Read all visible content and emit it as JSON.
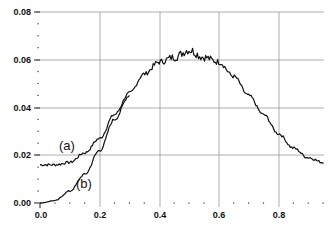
{
  "chart_data": {
    "type": "line",
    "title": "",
    "xlabel": "",
    "ylabel": "",
    "xlim": [
      0.0,
      0.95
    ],
    "ylim": [
      0.0,
      0.08
    ],
    "grid": true,
    "x_ticks": [
      "0.0",
      "0.2",
      "0.4",
      "0.6",
      "0.8"
    ],
    "y_ticks": [
      "0.00",
      "0.02",
      "0.04",
      "0.06",
      "0.08"
    ],
    "legend": null,
    "annotations": [
      "(a)",
      "(b)"
    ],
    "series": [
      {
        "name": "(a)",
        "x": [
          0.0,
          0.05,
          0.1,
          0.15,
          0.2,
          0.25,
          0.3,
          0.35,
          0.4,
          0.45,
          0.5,
          0.55,
          0.6,
          0.65,
          0.7,
          0.75,
          0.8,
          0.85,
          0.9,
          0.95
        ],
        "values": [
          0.016,
          0.016,
          0.017,
          0.021,
          0.027,
          0.037,
          0.046,
          0.054,
          0.059,
          0.061,
          0.064,
          0.061,
          0.059,
          0.053,
          0.045,
          0.037,
          0.029,
          0.023,
          0.019,
          0.017
        ]
      },
      {
        "name": "(b)",
        "x": [
          0.0,
          0.05,
          0.1,
          0.15,
          0.2,
          0.25,
          0.3
        ],
        "values": [
          0.0,
          0.001,
          0.005,
          0.012,
          0.022,
          0.035,
          0.045
        ]
      }
    ]
  },
  "axes": {
    "x_tick_labels": [
      "0.0",
      "0.2",
      "0.4",
      "0.6",
      "0.8"
    ],
    "y_tick_labels": [
      "0.00",
      "0.02",
      "0.04",
      "0.06",
      "0.08"
    ]
  },
  "annotations": {
    "a_label": "(a)",
    "b_label": "(b)"
  }
}
